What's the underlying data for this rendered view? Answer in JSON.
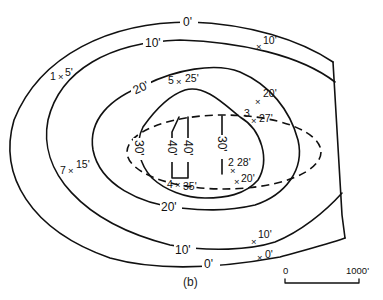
{
  "figure": {
    "caption": "(b)",
    "ink_color": "#111111",
    "background": "#ffffff"
  },
  "contours": {
    "c0_top": "0'",
    "c0_bottom": "0'",
    "c10_top": "10'",
    "c10_bottom": "10'",
    "c20_top": "20'",
    "c20_bottom": "20'",
    "c30_left": "30'",
    "c30_right": "30'",
    "c40_left": "40'",
    "c40_right": "40'"
  },
  "wells": [
    {
      "id": "1",
      "depth": "5'"
    },
    {
      "id": "2",
      "depth": "28'"
    },
    {
      "id": "3",
      "depth": "27'"
    },
    {
      "id": "4",
      "depth": "35'"
    },
    {
      "id": "5",
      "depth": "25'"
    },
    {
      "id": "7",
      "depth": "15'"
    }
  ],
  "unnumbered_points": [
    {
      "depth": "10'",
      "position": "top-right"
    },
    {
      "depth": "20'",
      "position": "upper-right"
    },
    {
      "depth": "20'",
      "position": "lower-right"
    },
    {
      "depth": "10'",
      "position": "bottom-right"
    },
    {
      "depth": "0'",
      "position": "bottom-right"
    }
  ],
  "marker_symbol": "×",
  "scale_bar": {
    "start_label": "0",
    "end_label": "1000'"
  }
}
